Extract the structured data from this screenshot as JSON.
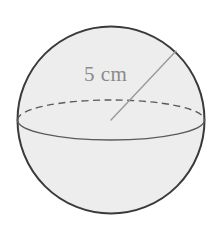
{
  "figure": {
    "name": "sphere-diagram",
    "shape": "sphere",
    "background_color": "#ffffff",
    "fill_color": "#ededed",
    "outline_color": "#3a3a3a",
    "equator_color": "#5a5a5a",
    "radius_line_color": "#9a9a9a",
    "label_color": "#8a8a8a",
    "sphere": {
      "center_x": 111,
      "center_y": 120,
      "radius": 94
    },
    "equator": {
      "semi_major_x": 93,
      "semi_minor_y": 20,
      "front_style": "solid",
      "back_style": "dashed"
    },
    "radius_line": {
      "from_x": 111,
      "from_y": 120,
      "to_x": 176,
      "to_y": 51
    },
    "measurement": {
      "label": "5 cm",
      "value": "5",
      "unit": "cm",
      "measures": "radius"
    }
  }
}
